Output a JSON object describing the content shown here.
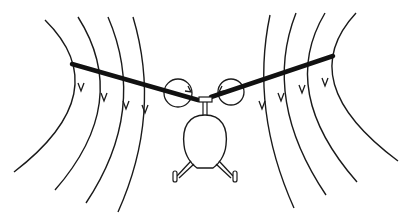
{
  "figure": {
    "colors": {
      "background": "#ffffff",
      "ink": "#111111"
    },
    "flow_lines_left": [
      {
        "d": "M45,20 Q118,92 14,172",
        "arrow": [
          81,
          90
        ]
      },
      {
        "d": "M78,17 Q132,102 55,190",
        "arrow": [
          104,
          100
        ]
      },
      {
        "d": "M108,17 Q148,110 86,203",
        "arrow": [
          126,
          108
        ]
      },
      {
        "d": "M133,17 Q162,114 118,212",
        "arrow": [
          145,
          112
        ]
      }
    ],
    "flow_lines_right": [
      {
        "d": "M270,15 Q250,110 294,208",
        "arrow": [
          262,
          108
        ]
      },
      {
        "d": "M296,13 Q262,100 326,195",
        "arrow": [
          281,
          100
        ]
      },
      {
        "d": "M325,13 Q278,92 357,182",
        "arrow": [
          302,
          92
        ]
      },
      {
        "d": "M356,13 Q292,82 398,161",
        "arrow": [
          325,
          85
        ]
      }
    ],
    "blades": {
      "left": [
        72,
        64,
        198,
        100
      ],
      "right": [
        211,
        97,
        333,
        56
      ]
    },
    "tip_vortex_circles": {
      "left": {
        "cx": 178,
        "cy": 93,
        "r": 14
      },
      "right": {
        "cx": 231,
        "cy": 92,
        "r": 13
      }
    }
  }
}
